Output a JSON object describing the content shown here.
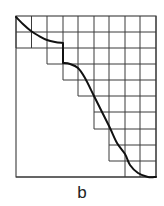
{
  "figure": {
    "caption": "b",
    "colors": {
      "grid": "#3a3a3a",
      "curve": "#111111",
      "background": "#ffffff"
    },
    "frame": {
      "x0": 16,
      "y0": 16,
      "x1": 156,
      "y1": 177
    },
    "columns_x": [
      16,
      31.5,
      47,
      63,
      78,
      94,
      109,
      125,
      140,
      156
    ],
    "rows_y": [
      16,
      32,
      48,
      64,
      80,
      96,
      112,
      129,
      145,
      161,
      177
    ],
    "staircase_row_start_col": [
      0,
      0,
      2,
      3,
      4,
      5,
      5,
      6,
      6,
      7
    ],
    "curve_points": [
      [
        16,
        17
      ],
      [
        24,
        25
      ],
      [
        31,
        31
      ],
      [
        39,
        36
      ],
      [
        47,
        40
      ],
      [
        55,
        42
      ],
      [
        63,
        43
      ],
      [
        63,
        63
      ],
      [
        70,
        64
      ],
      [
        78,
        68
      ],
      [
        85,
        78
      ],
      [
        94,
        96
      ],
      [
        102,
        112
      ],
      [
        110,
        128
      ],
      [
        117,
        143
      ],
      [
        125,
        154
      ],
      [
        130,
        165
      ],
      [
        138,
        173
      ],
      [
        148,
        177
      ],
      [
        156,
        177
      ]
    ]
  }
}
